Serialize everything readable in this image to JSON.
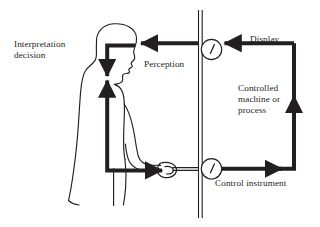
{
  "diagram": {
    "type": "block-flow-diagram",
    "background_color": "#ffffff",
    "ink_color": "#231f20",
    "labels": {
      "interpretation_line1": "Interpretation",
      "interpretation_line2": "decision",
      "perception": "Perception",
      "display": "Display",
      "controlled_line1": "Controlled",
      "controlled_line2": "machine or",
      "controlled_line3": "process",
      "control_instrument": "Control instrument"
    },
    "elements": {
      "operator": "human operator side profile",
      "panel": "vertical double-line separation panel",
      "display_gauge": "round dial gauge with needle",
      "control_gauge": "round dial gauge with needle",
      "hand_control": "hand gripping control lever"
    },
    "flow": [
      "Display -> display gauge -> Perception -> operator head",
      "Interpretation decision inside operator",
      "operator arm -> hand on control -> Control instrument",
      "Control instrument -> Controlled machine or process -> Display"
    ]
  }
}
